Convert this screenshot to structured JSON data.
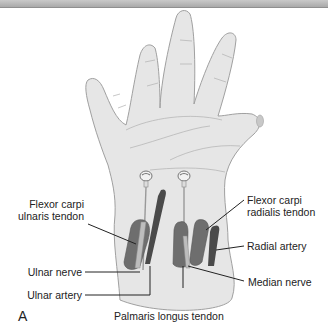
{
  "figure": {
    "panel_letter": "A",
    "labels": {
      "fcu_line1": "Flexor carpi",
      "fcu_line2": "ulnaris tendon",
      "ulnar_nerve": "Ulnar nerve",
      "ulnar_artery": "Ulnar artery",
      "fcr_line1": "Flexor carpi",
      "fcr_line2": "radialis tendon",
      "radial_artery": "Radial artery",
      "median_nerve": "Median nerve",
      "palmaris_longus": "Palmaris longus tendon"
    },
    "colors": {
      "skin": "#e6e6e6",
      "outline": "#9a9a9a",
      "tendon": "#6e6e6e",
      "artery": "#4a4a4a",
      "header": "#b5b5b5"
    }
  }
}
